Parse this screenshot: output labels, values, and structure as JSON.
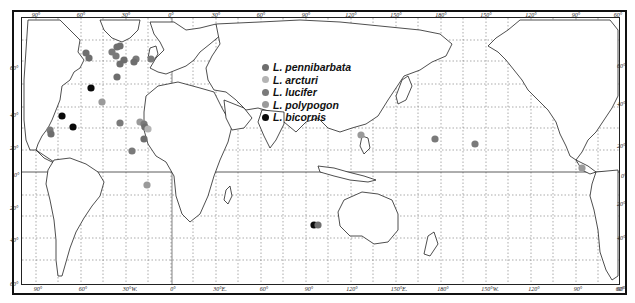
{
  "map": {
    "type": "world distribution map (Mercator, Pacific-centered)",
    "top_longitude_labels": [
      "90°",
      "60°",
      "30°",
      "0°",
      "30°",
      "60°",
      "90°",
      "120°",
      "150°",
      "180°",
      "150°",
      "120°",
      "90°",
      "60°"
    ],
    "bottom_longitude_labels": [
      "90°",
      "60°",
      "30°W.",
      "0°",
      "30°E.",
      "60°",
      "90°",
      "120°",
      "150°E.",
      "180°",
      "150°W.",
      "120°",
      "90°",
      "60°"
    ],
    "left_latitude_labels": [
      "60°",
      "40°",
      "20°",
      "0°",
      "20°",
      "40°",
      "60°"
    ],
    "right_latitude_labels": [
      "60°",
      "40°",
      "20°",
      "0°",
      "20°",
      "40°",
      "60°"
    ]
  },
  "legend": {
    "items": [
      {
        "label": "L. pennibarbata",
        "color": "#6e6e6e"
      },
      {
        "label": "L. arcturi",
        "color": "#b4b4b4"
      },
      {
        "label": "L. lucifer",
        "color": "#7a7a7a"
      },
      {
        "label": "L. polypogon",
        "color": "#9a9a9a"
      },
      {
        "label": "L. bicornis",
        "color": "#0a0a0a"
      }
    ]
  },
  "points": [
    {
      "species": "L. pennibarbata",
      "x": 86,
      "y": 53
    },
    {
      "species": "L. pennibarbata",
      "x": 89,
      "y": 58
    },
    {
      "species": "L. lucifer",
      "x": 112,
      "y": 52
    },
    {
      "species": "L. pennibarbata",
      "x": 117,
      "y": 47
    },
    {
      "species": "L. pennibarbata",
      "x": 120,
      "y": 46
    },
    {
      "species": "L. lucifer",
      "x": 116,
      "y": 56
    },
    {
      "species": "L. pennibarbata",
      "x": 124,
      "y": 60
    },
    {
      "species": "L. pennibarbata",
      "x": 120,
      "y": 64
    },
    {
      "species": "L. lucifer",
      "x": 136,
      "y": 59
    },
    {
      "species": "L. pennibarbata",
      "x": 134,
      "y": 62
    },
    {
      "species": "L. lucifer",
      "x": 151,
      "y": 59
    },
    {
      "species": "L. pennibarbata",
      "x": 117,
      "y": 77
    },
    {
      "species": "L. bicornis",
      "x": 91,
      "y": 88
    },
    {
      "species": "L. polypogon",
      "x": 102,
      "y": 102
    },
    {
      "species": "L. bicornis",
      "x": 62,
      "y": 116
    },
    {
      "species": "L. bicornis",
      "x": 73,
      "y": 127
    },
    {
      "species": "L. lucifer",
      "x": 50,
      "y": 130
    },
    {
      "species": "L. pennibarbata",
      "x": 51,
      "y": 134
    },
    {
      "species": "L. lucifer",
      "x": 120,
      "y": 123
    },
    {
      "species": "L. polypogon",
      "x": 140,
      "y": 122
    },
    {
      "species": "L. lucifer",
      "x": 144,
      "y": 124
    },
    {
      "species": "L. pennibarbata",
      "x": 145,
      "y": 127
    },
    {
      "species": "L. arcturi",
      "x": 148,
      "y": 129
    },
    {
      "species": "L. pennibarbata",
      "x": 144,
      "y": 139
    },
    {
      "species": "L. lucifer",
      "x": 132,
      "y": 151
    },
    {
      "species": "L. polypogon",
      "x": 147,
      "y": 185
    },
    {
      "species": "L. polypogon",
      "x": 361,
      "y": 135
    },
    {
      "species": "L. lucifer",
      "x": 435,
      "y": 139
    },
    {
      "species": "L. lucifer",
      "x": 475,
      "y": 144
    },
    {
      "species": "L. polypogon",
      "x": 582,
      "y": 168
    },
    {
      "species": "L. bicornis",
      "x": 314,
      "y": 225
    },
    {
      "species": "L. pennibarbata",
      "x": 318,
      "y": 225
    }
  ]
}
